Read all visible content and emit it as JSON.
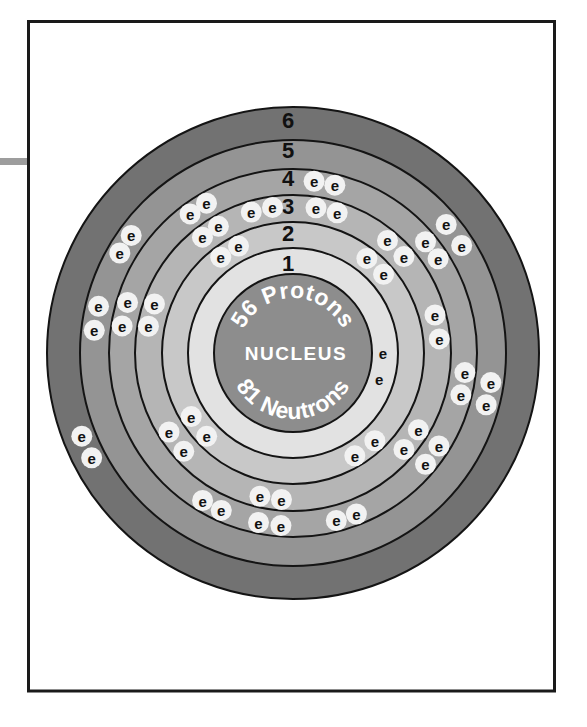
{
  "diagram": {
    "nucleus": {
      "label": "NUCLEUS",
      "protons": "56 Protons",
      "neutrons": "81 Neutrons",
      "radius": 79,
      "color": "#8d8d8d"
    },
    "electron_symbol": "e",
    "shells": [
      {
        "number": "1",
        "electron_count": 2,
        "ring_outer_radius": 105,
        "ring_color": "#e2e2e2",
        "electron_radius": 90,
        "label_radius": 90,
        "halo": false,
        "electron_angles": [
          0,
          -17
        ]
      },
      {
        "number": "2",
        "electron_count": 8,
        "ring_outer_radius": 131,
        "ring_color": "#c8c8c8",
        "electron_radius": 120,
        "label_radius": 120,
        "halo": true,
        "electron_angles": [
          127,
          117,
          52,
          41,
          -47,
          -59,
          -136,
          -148
        ]
      },
      {
        "number": "3",
        "electron_count": 18,
        "ring_outer_radius": 158,
        "ring_color": "#b5b5b5",
        "electron_radius": 147,
        "label_radius": 147,
        "halo": true,
        "electron_angles": [
          169.5,
          160.5,
          128,
          120.5,
          106.5,
          98,
          81,
          72.5,
          50,
          41,
          15,
          5.5,
          -31.5,
          -41,
          -94.5,
          -103,
          -138,
          -147.5
        ]
      },
      {
        "number": "4",
        "electron_count": 18,
        "ring_outer_radius": 184,
        "ring_color": "#a5a5a5",
        "electron_radius": 173,
        "label_radius": 175,
        "halo": true,
        "electron_angles": [
          171,
          163,
          126.5,
          120,
          83,
          76,
          40,
          33,
          -6.5,
          -14,
          -32.5,
          -40,
          -68.5,
          -75.5,
          -94,
          -101.5,
          -114.5,
          -121.5
        ]
      },
      {
        "number": "5",
        "electron_count": 8,
        "ring_outer_radius": 213,
        "ring_color": "#949494",
        "electron_radius": 200,
        "label_radius": 203,
        "halo": true,
        "electron_angles": [
          173.5,
          166.5,
          150,
          144,
          40,
          32.5,
          -8.5,
          -15
        ]
      },
      {
        "number": "6",
        "electron_count": 2,
        "ring_outer_radius": 246,
        "ring_color": "#727272",
        "electron_radius": 227,
        "label_radius": 233,
        "halo": true,
        "electron_angles": [
          -152.5,
          -158.5
        ]
      }
    ]
  },
  "colors": {
    "background": "#ffffff",
    "frame_stroke": "#1a1a1a",
    "margin_tab": "#9d9d9d",
    "ring_stroke": "#141414",
    "electron_halo": "#f2f2f2",
    "electron_text": "#111111",
    "shell_label_text": "#111111",
    "nucleus_text": "#ffffff"
  }
}
